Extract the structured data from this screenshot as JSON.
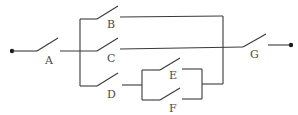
{
  "diagram": {
    "type": "switch-circuit",
    "colors": {
      "line": "#3a3a3a",
      "terminal": "#1a1a1a",
      "label": "#4a4a4a",
      "background": "#ffffff"
    },
    "terminals": [
      {
        "id": "left-terminal",
        "x": 12,
        "y": 51
      },
      {
        "id": "right-terminal",
        "x": 291,
        "y": 45
      }
    ],
    "switches": {
      "A": {
        "label": "A",
        "state": "open"
      },
      "B": {
        "label": "B",
        "state": "open"
      },
      "C": {
        "label": "C",
        "state": "open"
      },
      "D": {
        "label": "D",
        "state": "open"
      },
      "E": {
        "label": "E",
        "state": "open"
      },
      "F": {
        "label": "F",
        "state": "open"
      },
      "G": {
        "label": "G",
        "state": "open"
      }
    },
    "topology": {
      "series": [
        "A",
        "parallel(B, C, D-series-parallel(E, F))",
        "G"
      ],
      "notes": "B and D rejoin via the right bus onto the C line before switch G; E and F are in parallel, in series after D"
    }
  }
}
